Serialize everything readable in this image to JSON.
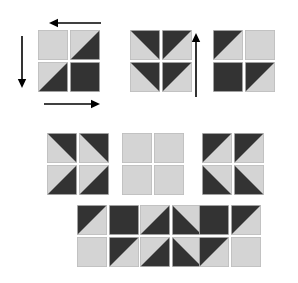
{
  "canvas": {
    "width": 298,
    "height": 283,
    "background": "#ffffff"
  },
  "palette": {
    "light": "#d4d4d4",
    "dark": "#333333",
    "edge": "#bdbdbd",
    "arrow": "#000000",
    "background": "#ffffff"
  },
  "tile_size": 30,
  "tile_gap": 2,
  "figure": {
    "group_count": 9,
    "arrow_count": 3
  },
  "groups": [
    {
      "id": "group-top-left",
      "name": "top-left-group",
      "x": 38,
      "y": 30,
      "label": "light, anti-diagonal, anti-diagonal, dark",
      "tiles": [
        {
          "name": "tile-tl",
          "fill": "light"
        },
        {
          "name": "tile-tr",
          "fill": "split-tl-light-br-dark"
        },
        {
          "name": "tile-bl",
          "fill": "split-tl-light-br-dark"
        },
        {
          "name": "tile-br",
          "fill": "dark"
        }
      ]
    },
    {
      "id": "group-top-middle",
      "name": "top-middle-group",
      "x": 130,
      "y": 30,
      "label": "two stacked up-pointing chevrons",
      "tiles": [
        {
          "name": "tile-tl",
          "fill": "split-bl-light-tr-dark"
        },
        {
          "name": "tile-tr",
          "fill": "split-br-light-tl-dark"
        },
        {
          "name": "tile-bl",
          "fill": "split-bl-light-tr-dark"
        },
        {
          "name": "tile-br",
          "fill": "split-br-light-tl-dark"
        }
      ]
    },
    {
      "id": "group-top-right",
      "name": "top-right-group",
      "x": 213,
      "y": 30,
      "label": "anti-diagonal, light, dark, anti-diagonal",
      "tiles": [
        {
          "name": "tile-tl",
          "fill": "split-br-light-tl-dark"
        },
        {
          "name": "tile-tr",
          "fill": "light"
        },
        {
          "name": "tile-bl",
          "fill": "dark"
        },
        {
          "name": "tile-br",
          "fill": "split-br-light-tl-dark"
        }
      ]
    },
    {
      "id": "group-mid-left",
      "name": "middle-left-group",
      "x": 47,
      "y": 133,
      "label": "two side-by-side left-pointing chevrons",
      "tiles": [
        {
          "name": "tile-tl",
          "fill": "split-bl-light-tr-dark"
        },
        {
          "name": "tile-tr",
          "fill": "split-bl-light-tr-dark"
        },
        {
          "name": "tile-bl",
          "fill": "split-tl-light-br-dark"
        },
        {
          "name": "tile-br",
          "fill": "split-tl-light-br-dark"
        }
      ]
    },
    {
      "id": "group-mid-middle",
      "name": "middle-middle-group",
      "x": 122,
      "y": 133,
      "label": "four plain light squares",
      "tiles": [
        {
          "name": "tile-tl",
          "fill": "light"
        },
        {
          "name": "tile-tr",
          "fill": "light"
        },
        {
          "name": "tile-bl",
          "fill": "light"
        },
        {
          "name": "tile-br",
          "fill": "light"
        }
      ]
    },
    {
      "id": "group-mid-right",
      "name": "middle-right-group",
      "x": 202,
      "y": 133,
      "label": "two side-by-side right-pointing chevrons",
      "tiles": [
        {
          "name": "tile-tl",
          "fill": "split-br-light-tl-dark"
        },
        {
          "name": "tile-tr",
          "fill": "split-br-light-tl-dark"
        },
        {
          "name": "tile-bl",
          "fill": "split-tr-light-bl-dark"
        },
        {
          "name": "tile-br",
          "fill": "split-tr-light-bl-dark"
        }
      ]
    },
    {
      "id": "group-bottom-left",
      "name": "bottom-left-group",
      "x": 77,
      "y": 205,
      "label": "dark upper-left half, light lower-right half",
      "tiles": [
        {
          "name": "tile-tl",
          "fill": "split-br-light-tl-dark"
        },
        {
          "name": "tile-tr",
          "fill": "dark"
        },
        {
          "name": "tile-bl",
          "fill": "light"
        },
        {
          "name": "tile-br",
          "fill": "split-br-light-tl-dark"
        }
      ]
    },
    {
      "id": "group-bottom-middle",
      "name": "bottom-middle-group",
      "x": 140,
      "y": 205,
      "label": "two stacked down-pointing chevrons",
      "tiles": [
        {
          "name": "tile-tl",
          "fill": "split-tl-light-br-dark"
        },
        {
          "name": "tile-tr",
          "fill": "split-tr-light-bl-dark"
        },
        {
          "name": "tile-bl",
          "fill": "split-tl-light-br-dark"
        },
        {
          "name": "tile-br",
          "fill": "split-tr-light-bl-dark"
        }
      ]
    },
    {
      "id": "group-bottom-right",
      "name": "bottom-right-group",
      "x": 199,
      "y": 205,
      "label": "dark upper-left half, light lower-right half",
      "tiles": [
        {
          "name": "tile-tl",
          "fill": "dark"
        },
        {
          "name": "tile-tr",
          "fill": "split-br-light-tl-dark"
        },
        {
          "name": "tile-bl",
          "fill": "split-br-light-tl-dark"
        },
        {
          "name": "tile-br",
          "fill": "light"
        }
      ]
    }
  ],
  "arrows": [
    {
      "id": "arrow-top",
      "name": "arrow-left",
      "direction": "left",
      "x1": 101,
      "y1": 23,
      "x2": 49,
      "y2": 23
    },
    {
      "id": "arrow-left",
      "name": "arrow-down",
      "direction": "down",
      "x1": 22,
      "y1": 36,
      "x2": 22,
      "y2": 88
    },
    {
      "id": "arrow-bottom",
      "name": "arrow-right",
      "direction": "right",
      "x1": 44,
      "y1": 104,
      "x2": 100,
      "y2": 104
    },
    {
      "id": "arrow-upright",
      "name": "arrow-up",
      "direction": "up",
      "x1": 196,
      "y1": 97,
      "x2": 196,
      "y2": 33
    }
  ]
}
